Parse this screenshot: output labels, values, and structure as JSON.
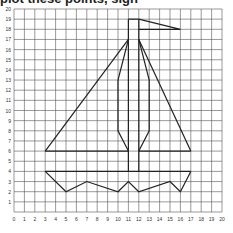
{
  "header_cut_text": "plot these points, sign ",
  "grid": {
    "x_min": 0,
    "x_max": 20,
    "y_min": 0,
    "y_max": 20,
    "x_labels": [
      "0",
      "1",
      "2",
      "3",
      "4",
      "5",
      "6",
      "7",
      "8",
      "9",
      "10",
      "11",
      "12",
      "13",
      "14",
      "15",
      "16",
      "17",
      "18",
      "19",
      "20"
    ],
    "y_labels": [
      "1",
      "2",
      "3",
      "4",
      "5",
      "6",
      "7",
      "8",
      "9",
      "10",
      "11",
      "12",
      "13",
      "14",
      "15",
      "16",
      "17",
      "18",
      "19",
      "20"
    ]
  },
  "figure": {
    "stroke_color": "#222222",
    "mast": [
      [
        [
          11,
          4
        ],
        [
          11,
          19
        ]
      ],
      [
        [
          12,
          4
        ],
        [
          12,
          19
        ]
      ]
    ],
    "mast_top": [
      [
        11,
        19
      ],
      [
        12,
        19
      ]
    ],
    "flag": [
      [
        12,
        19
      ],
      [
        16,
        18
      ],
      [
        12,
        18
      ]
    ],
    "left_sail": [
      [
        3,
        6
      ],
      [
        11,
        17
      ]
    ],
    "left_inner": [
      [
        11,
        17
      ],
      [
        10,
        13
      ],
      [
        10,
        8
      ],
      [
        11,
        6
      ]
    ],
    "right_sail": [
      [
        17,
        6
      ],
      [
        12,
        17
      ]
    ],
    "right_inner": [
      [
        12,
        17
      ],
      [
        13,
        13
      ],
      [
        13,
        8
      ],
      [
        12,
        6
      ]
    ],
    "boom_left": [
      [
        3,
        6
      ],
      [
        11,
        6
      ]
    ],
    "boom_right": [
      [
        12,
        6
      ],
      [
        17,
        6
      ]
    ],
    "deck": [
      [
        3,
        4
      ],
      [
        17,
        4
      ]
    ],
    "hull_bottom": [
      [
        3,
        4
      ],
      [
        5,
        2
      ],
      [
        7,
        3
      ],
      [
        10,
        2
      ],
      [
        11,
        3
      ],
      [
        12,
        2
      ],
      [
        15,
        3
      ],
      [
        16,
        2
      ],
      [
        17,
        4
      ]
    ]
  }
}
